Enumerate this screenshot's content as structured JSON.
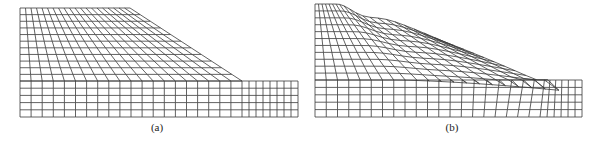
{
  "figure": {
    "panels": [
      {
        "id": "a",
        "label": "(a)",
        "description": "Undeformed finite element mesh of slope",
        "caption_x": 157,
        "mesh": {
          "left": 20,
          "top": 8,
          "crest_x": 130,
          "toe_x": 242,
          "base_top": 81,
          "bottom": 117,
          "right": 298,
          "slope_cols": 20,
          "slope_rows": 11,
          "base_rows": 5,
          "ext_cols": 8
        },
        "deformed": false
      },
      {
        "id": "b",
        "label": "(b)",
        "description": "Deformed finite element mesh showing slope failure",
        "caption_x": 452,
        "mesh": {
          "left": 315,
          "top": 4,
          "crest_x": 385,
          "toe_x": 540,
          "base_top": 80,
          "bottom": 117,
          "right": 582,
          "slope_cols": 20,
          "slope_rows": 11,
          "base_rows": 5,
          "ext_cols": 6
        },
        "deformed": true
      }
    ],
    "line_color": "#3a3a3a"
  }
}
